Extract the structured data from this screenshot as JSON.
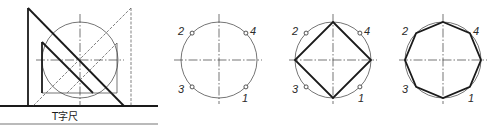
{
  "figure": {
    "panel_a": {
      "ruler_label": "T字尺",
      "circle": {
        "cx": 80,
        "cy": 60,
        "r": 38
      }
    },
    "panel_b": {
      "description": "circle with four marked points",
      "circle": {
        "cx": 219,
        "cy": 60,
        "r": 38
      },
      "points": [
        {
          "label": "1",
          "angle": -45
        },
        {
          "label": "2",
          "angle": 135
        },
        {
          "label": "3",
          "angle": -135
        },
        {
          "label": "4",
          "angle": 45
        }
      ]
    },
    "panel_c": {
      "description": "inscribed square",
      "circle": {
        "cx": 333,
        "cy": 60,
        "r": 38
      },
      "points": [
        {
          "label": "1"
        },
        {
          "label": "2"
        },
        {
          "label": "3"
        },
        {
          "label": "4"
        }
      ]
    },
    "panel_d": {
      "description": "inscribed regular octagon",
      "circle": {
        "cx": 443,
        "cy": 60,
        "r": 38
      },
      "points": [
        {
          "label": "1"
        },
        {
          "label": "2"
        },
        {
          "label": "3"
        },
        {
          "label": "4"
        }
      ]
    },
    "colors": {
      "line": "#1a1a1a",
      "background": "#ffffff"
    }
  }
}
